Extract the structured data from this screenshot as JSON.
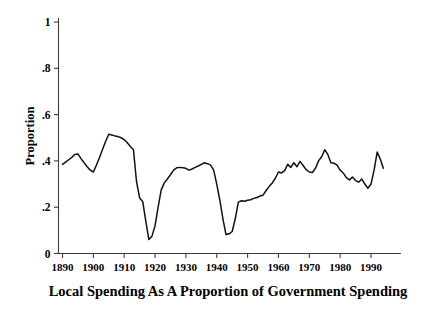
{
  "chart_data": {
    "type": "line",
    "title": "",
    "caption": "Local Spending As A Proportion of Government Spending",
    "xlabel": "",
    "ylabel": "Proportion",
    "xlim": [
      1888,
      1995
    ],
    "ylim": [
      0,
      1.05
    ],
    "grid": false,
    "legend": null,
    "x_ticks": [
      1890,
      1900,
      1910,
      1920,
      1930,
      1940,
      1950,
      1960,
      1970,
      1980,
      1990
    ],
    "x_tick_labels": [
      "1890",
      "1900",
      "1910",
      "1920",
      "1930",
      "1940",
      "1950",
      "1960",
      "1970",
      "1980",
      "1990"
    ],
    "y_ticks": [
      0,
      0.2,
      0.4,
      0.6,
      0.8,
      1
    ],
    "y_tick_labels": [
      "0",
      ".2",
      ".4",
      ".6",
      ".8",
      "1"
    ],
    "series": [
      {
        "name": "Local Spending Proportion",
        "color": "#111111",
        "x": [
          1890,
          1891,
          1892,
          1893,
          1894,
          1895,
          1896,
          1897,
          1898,
          1899,
          1900,
          1901,
          1902,
          1903,
          1904,
          1905,
          1906,
          1907,
          1908,
          1909,
          1910,
          1911,
          1912,
          1913,
          1914,
          1915,
          1916,
          1917,
          1918,
          1919,
          1920,
          1921,
          1922,
          1923,
          1924,
          1925,
          1926,
          1927,
          1928,
          1929,
          1930,
          1931,
          1932,
          1933,
          1934,
          1935,
          1936,
          1937,
          1938,
          1939,
          1940,
          1941,
          1942,
          1943,
          1944,
          1945,
          1946,
          1947,
          1948,
          1949,
          1950,
          1951,
          1952,
          1953,
          1954,
          1955,
          1956,
          1957,
          1958,
          1959,
          1960,
          1961,
          1962,
          1963,
          1964,
          1965,
          1966,
          1967,
          1968,
          1969,
          1970,
          1971,
          1972,
          1973,
          1974,
          1975,
          1976,
          1977,
          1978,
          1979,
          1980,
          1981,
          1982,
          1983,
          1984,
          1985,
          1986,
          1987,
          1988,
          1989,
          1990,
          1991,
          1992,
          1993,
          1994
        ],
        "y": [
          0.385,
          0.395,
          0.405,
          0.415,
          0.428,
          0.43,
          0.41,
          0.392,
          0.375,
          0.36,
          0.352,
          0.382,
          0.415,
          0.45,
          0.485,
          0.515,
          0.512,
          0.508,
          0.505,
          0.5,
          0.492,
          0.478,
          0.462,
          0.448,
          0.31,
          0.24,
          0.225,
          0.14,
          0.06,
          0.075,
          0.12,
          0.2,
          0.275,
          0.305,
          0.322,
          0.34,
          0.36,
          0.37,
          0.372,
          0.37,
          0.368,
          0.36,
          0.365,
          0.372,
          0.378,
          0.385,
          0.392,
          0.388,
          0.382,
          0.36,
          0.3,
          0.23,
          0.15,
          0.082,
          0.085,
          0.095,
          0.15,
          0.222,
          0.228,
          0.226,
          0.23,
          0.232,
          0.238,
          0.242,
          0.248,
          0.252,
          0.272,
          0.29,
          0.305,
          0.325,
          0.352,
          0.348,
          0.358,
          0.385,
          0.372,
          0.392,
          0.375,
          0.398,
          0.38,
          0.362,
          0.352,
          0.35,
          0.368,
          0.4,
          0.418,
          0.448,
          0.428,
          0.392,
          0.39,
          0.382,
          0.36,
          0.348,
          0.328,
          0.318,
          0.33,
          0.315,
          0.308,
          0.322,
          0.3,
          0.282,
          0.3,
          0.36,
          0.438,
          0.408,
          0.368
        ]
      }
    ]
  },
  "figure": {
    "background_color": "#ffffff",
    "line_color": "#111111",
    "axis_color": "#3d3d3d",
    "text_color": "#000000"
  }
}
